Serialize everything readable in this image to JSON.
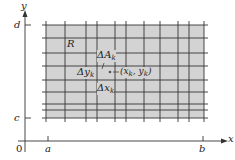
{
  "diagram": {
    "axes": {
      "x_label": "x",
      "y_label": "y",
      "origin_label": "0",
      "x_ticks": [
        "a",
        "b"
      ],
      "y_ticks": [
        "c",
        "d"
      ]
    },
    "region": {
      "label": "R",
      "fill": "#d3d3d3",
      "grid_color": "#333333",
      "x_range": [
        46,
        204
      ],
      "y_range": [
        25,
        118
      ],
      "vertical_lines": [
        46,
        65,
        86,
        97,
        115,
        126,
        144,
        160,
        178,
        189,
        204
      ],
      "horizontal_lines": [
        25,
        38,
        53,
        66,
        80,
        92,
        104,
        110,
        118
      ]
    },
    "annotations": {
      "delta_a": "ΔA",
      "delta_a_sub": "k",
      "delta_y": "Δy",
      "delta_y_sub": "k",
      "delta_x": "Δx",
      "delta_x_sub": "k",
      "point_label": "(x",
      "point_label_sub1": "k",
      "point_label_mid": ", y",
      "point_label_sub2": "k",
      "point_label_end": ")"
    },
    "colors": {
      "axis": "#333333",
      "text": "#222222",
      "background": "#ffffff"
    }
  }
}
